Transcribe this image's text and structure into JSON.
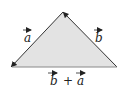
{
  "diagram": {
    "fill_color": "#e3e3e3",
    "stroke_color": "#333333",
    "vertices": {
      "apex": [
        63,
        12
      ],
      "bottom_left": [
        11,
        67
      ],
      "bottom_right": [
        117,
        67
      ]
    },
    "labels": {
      "side_a": "a",
      "side_b": "b",
      "base_b": "b",
      "base_plus": "+",
      "base_a": "a"
    }
  }
}
